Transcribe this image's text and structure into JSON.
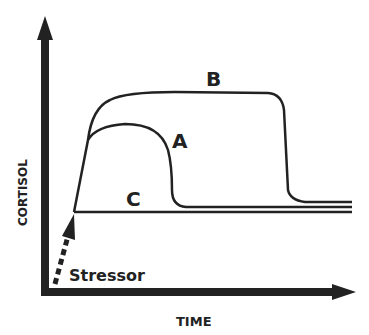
{
  "diagram": {
    "y_axis_label": "CORTISOL",
    "x_axis_label": "TIME",
    "stressor_label": "Stressor",
    "curves": [
      {
        "id": "B",
        "label": "B",
        "description": "prolonged high response"
      },
      {
        "id": "A",
        "label": "A",
        "description": "normal acute response"
      },
      {
        "id": "C",
        "label": "C",
        "description": "blunted/flat response"
      }
    ],
    "colors": {
      "ink": "#222222",
      "background": "#ffffff"
    }
  }
}
